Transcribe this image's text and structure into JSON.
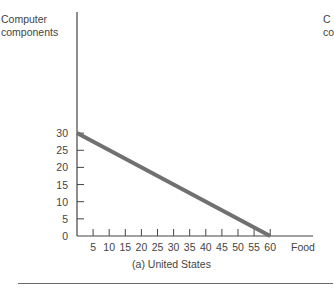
{
  "chart_data": {
    "type": "line",
    "title": "(a) United States",
    "xlabel": "Food",
    "ylabel": "Computer components",
    "x": [
      0,
      60
    ],
    "series": [
      {
        "name": "Production possibilities frontier",
        "values": [
          30,
          0
        ],
        "color": "#707070"
      }
    ],
    "xticks": [
      5,
      10,
      15,
      20,
      25,
      30,
      35,
      40,
      45,
      50,
      55,
      60
    ],
    "yticks": [
      0,
      5,
      10,
      15,
      20,
      25,
      30
    ],
    "xlim": [
      0,
      73
    ],
    "ylim": [
      0,
      65
    ],
    "grid": false
  },
  "labels": {
    "ylabel_line1": "Computer",
    "ylabel_line2": "components",
    "xlabel": "Food",
    "caption": "(a) United States",
    "next_panel_line1": "C",
    "next_panel_line2": "co"
  }
}
